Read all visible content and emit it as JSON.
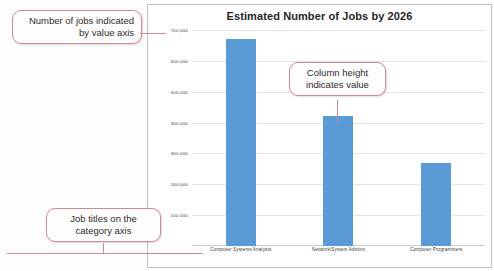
{
  "chart_data": {
    "type": "bar",
    "title": "Estimated Number of Jobs by 2026",
    "xlabel": "",
    "ylabel": "",
    "categories": [
      "Computer Systems Analysts",
      "Network/System Admins",
      "Computer Programmers"
    ],
    "values": [
      670000,
      420000,
      270000
    ],
    "ylim": [
      0,
      700000
    ],
    "ytick_labels": [
      "700,000",
      "600,000",
      "500,000",
      "400,000",
      "300,000",
      "200,000",
      "100,000"
    ],
    "ytick_values": [
      700000,
      600000,
      500000,
      400000,
      300000,
      200000,
      100000
    ],
    "grid": true,
    "legend": "none",
    "series_color": "#5B9BD5"
  },
  "callouts": [
    {
      "id": "value-axis",
      "text": "Number of jobs indicated by value axis"
    },
    {
      "id": "column-height",
      "text": "Column height indicates value"
    },
    {
      "id": "category-axis",
      "text": "Job titles on the category axis"
    }
  ],
  "colors": {
    "bar": "#5B9BD5",
    "callout_border": "#C98E93",
    "gridline": "#E4E4E4",
    "frame": "#BFBFBF"
  }
}
